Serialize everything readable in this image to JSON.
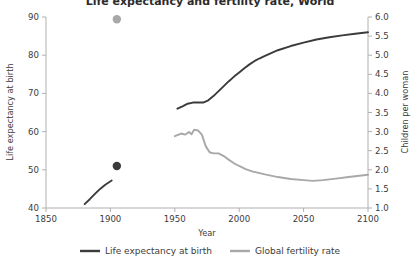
{
  "chart_data": {
    "type": "line",
    "title": "Life expectancy and fertility rate, World",
    "xlabel": "Year",
    "xlim": [
      1850,
      2100
    ],
    "xticks": [
      1850,
      1900,
      1950,
      2000,
      2050,
      2100
    ],
    "xtick_labels": [
      "1850",
      "1900",
      "1950",
      "2000",
      "2050",
      "2100"
    ],
    "grid": false,
    "legend_position": "bottom",
    "axes": [
      {
        "side": "left",
        "label": "Life expectancy at birth",
        "ylim": [
          40,
          90
        ],
        "yticks": [
          40,
          50,
          60,
          70,
          80,
          90
        ],
        "ytick_labels": [
          "40",
          "50",
          "60",
          "70",
          "80",
          "90"
        ],
        "color": "#3b3b3b"
      },
      {
        "side": "right",
        "label": "Children per woman",
        "ylim": [
          1.0,
          6.0
        ],
        "yticks": [
          1.0,
          1.5,
          2.0,
          2.5,
          3.0,
          3.5,
          4.0,
          4.5,
          5.0,
          5.5,
          6.0
        ],
        "ytick_labels": [
          "1.0",
          "1.5",
          "2.0",
          "2.5",
          "3.0",
          "3.5",
          "4.0",
          "4.5",
          "5.0",
          "5.5",
          "6.0"
        ],
        "color": "#3b3b3b"
      }
    ],
    "series": [
      {
        "name": "Life expectancy at birth",
        "axis": "left",
        "color": "#3b3b3b",
        "style": "line",
        "segments": [
          {
            "x": [
              1880,
              1884,
              1888,
              1892,
              1896,
              1901
            ],
            "values": [
              41.0,
              42.3,
              43.7,
              45.0,
              46.1,
              47.2
            ]
          },
          {
            "x": [
              1952,
              1956,
              1960,
              1964,
              1968,
              1972,
              1976,
              1980,
              1984,
              1988,
              1992,
              1996,
              2000,
              2004,
              2008,
              2012,
              2016,
              2020,
              2030,
              2040,
              2050,
              2060,
              2070,
              2080,
              2090,
              2100
            ],
            "values": [
              66.0,
              66.6,
              67.3,
              67.6,
              67.6,
              67.6,
              68.2,
              69.3,
              70.6,
              71.9,
              73.2,
              74.4,
              75.5,
              76.6,
              77.6,
              78.5,
              79.2,
              79.8,
              81.3,
              82.4,
              83.3,
              84.1,
              84.7,
              85.2,
              85.6,
              86.0
            ]
          }
        ]
      },
      {
        "name": "Global fertility rate",
        "axis": "right",
        "color": "#a8a8a8",
        "style": "line",
        "segments": [
          {
            "x": [
              1950,
              1955,
              1958,
              1961,
              1963,
              1965,
              1968,
              1971,
              1974,
              1977,
              1980,
              1984,
              1988,
              1992,
              1996,
              2000,
              2005,
              2010,
              2015,
              2020,
              2030,
              2040,
              2050,
              2057,
              2065,
              2075,
              2085,
              2095,
              2100
            ],
            "values": [
              2.88,
              2.95,
              2.92,
              2.99,
              2.93,
              3.05,
              3.03,
              2.92,
              2.62,
              2.46,
              2.43,
              2.43,
              2.36,
              2.26,
              2.17,
              2.1,
              2.02,
              1.96,
              1.92,
              1.88,
              1.81,
              1.76,
              1.73,
              1.71,
              1.73,
              1.77,
              1.81,
              1.85,
              1.87
            ]
          }
        ]
      }
    ],
    "points": [
      {
        "name": "life-expectancy-point",
        "axis": "left",
        "x": 1905,
        "value": 51.0,
        "color": "#3b3b3b",
        "radius": 4.2
      },
      {
        "name": "fertility-rate-point",
        "axis": "right",
        "x": 1905,
        "value": 5.94,
        "color": "#a8a8a8",
        "radius": 4.2
      }
    ],
    "legend": [
      {
        "label": "Life expectancy at birth",
        "color": "#3b3b3b"
      },
      {
        "label": "Global fertility rate",
        "color": "#a8a8a8"
      }
    ]
  },
  "colors": {
    "life_expectancy": "#3b3b3b",
    "fertility": "#a8a8a8",
    "axis": "#b0b0b0",
    "text": "#3b3b3b",
    "background": "#ffffff"
  }
}
